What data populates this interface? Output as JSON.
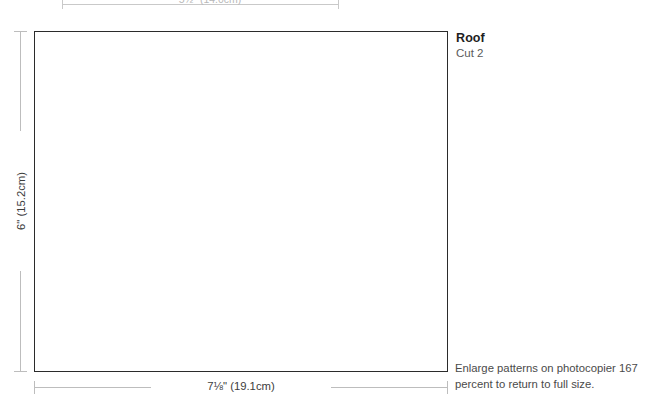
{
  "page": {
    "background_color": "#ffffff",
    "line_color": "#2b2b2b",
    "dimension_line_color": "#bdbdbd",
    "text_color": "#3c3c3c"
  },
  "previous_pattern": {
    "dimension_label": "5½\" (14.0cm)"
  },
  "pattern": {
    "title": "Roof",
    "cut_instruction": "Cut 2",
    "width_dimension": "7⅛\" (19.1cm)",
    "height_dimension": "6\" (15.2cm)"
  },
  "notes": {
    "enlarge_instruction": "Enlarge patterns on photocopier 167 percent to return to full size."
  }
}
